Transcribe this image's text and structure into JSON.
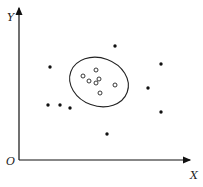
{
  "diagram": {
    "axes": {
      "x_label": "X",
      "y_label": "Y",
      "origin_label": "O"
    },
    "cluster": {
      "shape": "ellipse",
      "center": [
        100,
        83
      ],
      "rx": 30,
      "ry": 24,
      "points_open": [
        [
          83,
          76
        ],
        [
          96,
          70
        ],
        [
          89,
          81
        ],
        [
          99,
          79
        ],
        [
          96,
          83
        ],
        [
          100,
          93
        ],
        [
          115,
          85
        ]
      ]
    },
    "outliers_filled": [
      [
        50,
        67
      ],
      [
        115,
        46
      ],
      [
        161,
        64
      ],
      [
        48,
        105
      ],
      [
        60,
        105
      ],
      [
        70,
        108
      ],
      [
        148,
        88
      ],
      [
        161,
        112
      ],
      [
        107,
        134
      ]
    ]
  }
}
